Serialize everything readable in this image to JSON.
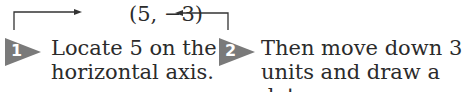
{
  "coordinate_label": "(5, −3)",
  "steps": [
    {
      "number": "1",
      "lines": [
        "Locate 5 on the",
        "horizontal axis."
      ]
    },
    {
      "number": "2",
      "lines": [
        "Then move down 3",
        "units and draw a dot."
      ]
    }
  ],
  "colors": {
    "badge": "#7a7a7a",
    "text": "#2b2b2b",
    "arrow": "#333333"
  }
}
